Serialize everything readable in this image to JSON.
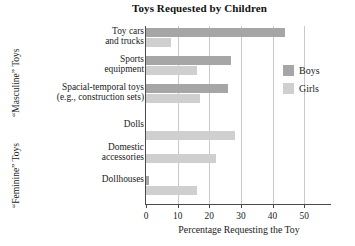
{
  "chart_data": {
    "type": "bar",
    "orientation": "horizontal",
    "title": "Toys Requested by Children",
    "xlabel": "Percentage Requesting the Toy",
    "ylabel": "",
    "xlim": [
      0,
      55
    ],
    "xticks": [
      0,
      10,
      20,
      30,
      40,
      50
    ],
    "xtick_labels": [
      "0",
      "10",
      "20",
      "30",
      "40",
      "50"
    ],
    "grid": true,
    "grid_axis": "x",
    "legend_position": "right",
    "categories": [
      "Toy cars and trucks",
      "Sports equipment",
      "Spacial-temporal toys (e.g., construction sets)",
      "Dolls",
      "Domestic accessories",
      "Dollhouses"
    ],
    "series": [
      {
        "name": "Boys",
        "color": "#a6a6a6",
        "values": [
          44,
          27,
          26,
          0,
          0,
          1
        ]
      },
      {
        "name": "Girls",
        "color": "#cfcfcf",
        "values": [
          8,
          16,
          17,
          28,
          22,
          16
        ]
      }
    ],
    "category_groups": [
      {
        "label": "“Masculine” Toys",
        "categories": [
          0,
          1,
          2
        ]
      },
      {
        "label": "“Feminine” Toys",
        "categories": [
          3,
          4,
          5
        ]
      }
    ]
  },
  "chart": {
    "title": "Toys Requested by Children",
    "xaxis_title": "Percentage Requesting the Toy",
    "group_labels": {
      "masculine": "“Masculine” Toys",
      "feminine": "“Feminine” Toys"
    },
    "category_labels": [
      {
        "line1": "Toy cars",
        "line2": "and trucks"
      },
      {
        "line1": "Sports",
        "line2": "equipment"
      },
      {
        "line1": "Spacial-temporal toys",
        "line2": "(e.g., construction sets)"
      },
      {
        "line1": "Dolls",
        "line2": ""
      },
      {
        "line1": "Domestic",
        "line2": "accessories"
      },
      {
        "line1": "Dollhouses",
        "line2": ""
      }
    ],
    "tick_labels": [
      "0",
      "10",
      "20",
      "30",
      "40",
      "50"
    ],
    "legend": [
      {
        "label": "Boys",
        "color": "#a6a6a6"
      },
      {
        "label": "Girls",
        "color": "#cfcfcf"
      }
    ]
  }
}
